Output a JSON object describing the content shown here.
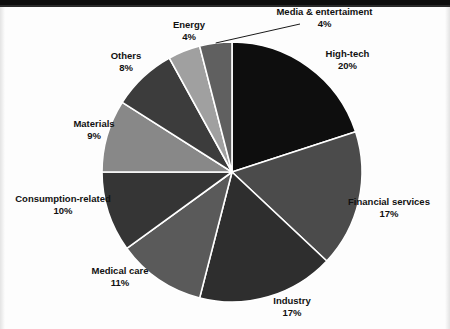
{
  "chart_data": {
    "type": "pie",
    "title": "",
    "subtitle": "",
    "xlabel": "",
    "ylabel": "",
    "grid": false,
    "legend_position": "none",
    "label_format": "name + percent, placed outside slices",
    "total_percent": 100,
    "start_angle_deg": 0,
    "direction": "clockwise",
    "center": {
      "x": 232,
      "y": 172
    },
    "radius": 130,
    "slice_separator_color": "#ffffff",
    "categories": [
      "High-tech",
      "Financial services",
      "Industry",
      "Medical care",
      "Consumption-related",
      "Materials",
      "Others",
      "Energy",
      "Media & entertaiment"
    ],
    "values": [
      20,
      17,
      17,
      11,
      10,
      9,
      8,
      4,
      4
    ],
    "value_labels": [
      "20%",
      "17%",
      "17%",
      "11%",
      "10%",
      "9%",
      "8%",
      "4%",
      "4%"
    ],
    "colors": [
      "#0e0e0e",
      "#4b4b4b",
      "#2e2e2e",
      "#5a5a5a",
      "#353535",
      "#888888",
      "#3c3c3c",
      "#a0a0a0",
      "#606060"
    ],
    "slices": [
      {
        "label": "High-tech",
        "value": 20,
        "value_label": "20%",
        "color": "#0e0e0e",
        "start_angle": 0,
        "end_angle": 72,
        "leader_line": false
      },
      {
        "label": "Financial services",
        "value": 17,
        "value_label": "17%",
        "color": "#4b4b4b",
        "start_angle": 72,
        "end_angle": 133.2,
        "leader_line": false
      },
      {
        "label": "Industry",
        "value": 17,
        "value_label": "17%",
        "color": "#2e2e2e",
        "start_angle": 133.2,
        "end_angle": 194.4,
        "leader_line": false
      },
      {
        "label": "Medical care",
        "value": 11,
        "value_label": "11%",
        "color": "#5a5a5a",
        "start_angle": 194.4,
        "end_angle": 234,
        "leader_line": false
      },
      {
        "label": "Consumption-related",
        "value": 10,
        "value_label": "10%",
        "color": "#353535",
        "start_angle": 234,
        "end_angle": 270,
        "leader_line": false
      },
      {
        "label": "Materials",
        "value": 9,
        "value_label": "9%",
        "color": "#888888",
        "start_angle": 270,
        "end_angle": 302.4,
        "leader_line": false
      },
      {
        "label": "Others",
        "value": 8,
        "value_label": "8%",
        "color": "#3c3c3c",
        "start_angle": 302.4,
        "end_angle": 331.2,
        "leader_line": false
      },
      {
        "label": "Energy",
        "value": 4,
        "value_label": "4%",
        "color": "#a0a0a0",
        "start_angle": 331.2,
        "end_angle": 345.6,
        "leader_line": false
      },
      {
        "label": "Media & entertaiment",
        "value": 4,
        "value_label": "4%",
        "color": "#606060",
        "start_angle": 345.6,
        "end_angle": 360,
        "leader_line": true
      }
    ]
  },
  "labels": {
    "media": {
      "name": "Media & entertaiment",
      "value": "4%"
    },
    "hightech": {
      "name": "High-tech",
      "value": "20%"
    },
    "financial": {
      "name": "Financial services",
      "value": "17%"
    },
    "industry": {
      "name": "Industry",
      "value": "17%"
    },
    "medical": {
      "name": "Medical care",
      "value": "11%"
    },
    "consumption": {
      "name": "Consumption-related",
      "value": "10%"
    },
    "materials": {
      "name": "Materials",
      "value": "9%"
    },
    "others": {
      "name": "Others",
      "value": "8%"
    },
    "energy": {
      "name": "Energy",
      "value": "4%"
    }
  }
}
